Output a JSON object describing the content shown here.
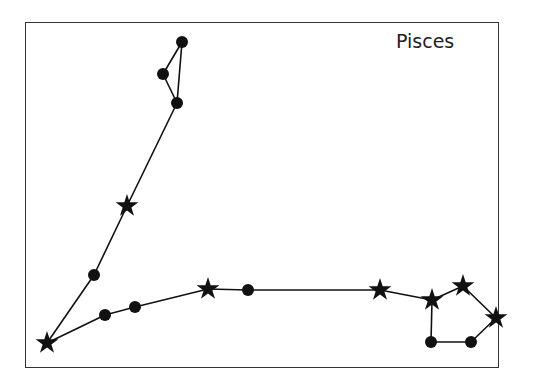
{
  "diagram": {
    "title": "Pisces",
    "colors": {
      "line": "#111111",
      "marker": "#111111",
      "frame": "#333333",
      "background": "#ffffff"
    },
    "nodes": [
      {
        "id": "n1",
        "type": "dot",
        "x": 182,
        "y": 42
      },
      {
        "id": "n2",
        "type": "dot",
        "x": 163,
        "y": 74
      },
      {
        "id": "n3",
        "type": "dot",
        "x": 177,
        "y": 103
      },
      {
        "id": "n4",
        "type": "star",
        "x": 127,
        "y": 206
      },
      {
        "id": "n5",
        "type": "dot",
        "x": 94,
        "y": 275
      },
      {
        "id": "n6",
        "type": "star",
        "x": 47,
        "y": 343
      },
      {
        "id": "n7",
        "type": "dot",
        "x": 105,
        "y": 315
      },
      {
        "id": "n8",
        "type": "dot",
        "x": 135,
        "y": 307
      },
      {
        "id": "n9",
        "type": "star",
        "x": 208,
        "y": 289
      },
      {
        "id": "n10",
        "type": "dot",
        "x": 248,
        "y": 290
      },
      {
        "id": "n11",
        "type": "star",
        "x": 380,
        "y": 290
      },
      {
        "id": "n12",
        "type": "star",
        "x": 432,
        "y": 300
      },
      {
        "id": "n13",
        "type": "star",
        "x": 463,
        "y": 286
      },
      {
        "id": "n14",
        "type": "star",
        "x": 496,
        "y": 318
      },
      {
        "id": "n15",
        "type": "dot",
        "x": 471,
        "y": 342
      },
      {
        "id": "n16",
        "type": "dot",
        "x": 431,
        "y": 342
      }
    ],
    "edges": [
      [
        "n1",
        "n2"
      ],
      [
        "n2",
        "n3"
      ],
      [
        "n3",
        "n1"
      ],
      [
        "n3",
        "n4"
      ],
      [
        "n4",
        "n5"
      ],
      [
        "n5",
        "n6"
      ],
      [
        "n6",
        "n7"
      ],
      [
        "n7",
        "n8"
      ],
      [
        "n8",
        "n9"
      ],
      [
        "n9",
        "n10"
      ],
      [
        "n10",
        "n11"
      ],
      [
        "n11",
        "n12"
      ],
      [
        "n12",
        "n13"
      ],
      [
        "n13",
        "n14"
      ],
      [
        "n14",
        "n15"
      ],
      [
        "n15",
        "n16"
      ],
      [
        "n16",
        "n12"
      ]
    ]
  }
}
